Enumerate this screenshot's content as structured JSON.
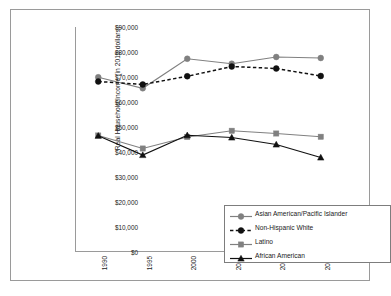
{
  "chart_data": {
    "type": "line",
    "title": "",
    "xlabel": "",
    "ylabel": "Real Household Income (in 2015 dollars)",
    "x": [
      1990,
      1995,
      2000,
      2005,
      2010,
      2015
    ],
    "categories": [
      "1990",
      "1995",
      "2000",
      "2005",
      "2010",
      "2015"
    ],
    "xticklabels": [
      "1990",
      "1995",
      "2000",
      "2005",
      "2010",
      "2015"
    ],
    "yticklabels": [
      "$0",
      "$10,000",
      "$20,000",
      "$30,000",
      "$40,000",
      "$50,000",
      "$60,000",
      "$70,000",
      "$80,000",
      "$90,000"
    ],
    "ytickvalues": [
      0,
      10000,
      20000,
      30000,
      40000,
      50000,
      60000,
      70000,
      80000,
      90000
    ],
    "ylim": [
      0,
      90000
    ],
    "xlim": [
      1990,
      2015
    ],
    "grid": false,
    "legend_position": "center-right-inside",
    "series": [
      {
        "name": "Asian American/Pacific Islander",
        "color": "#808080",
        "marker": "diamond",
        "linestyle": "solid",
        "values": [
          69900,
          65500,
          77300,
          75300,
          78000,
          77600
        ]
      },
      {
        "name": "Non-Hispanic White",
        "color": "#111111",
        "marker": "diamond",
        "linestyle": "dashed",
        "values": [
          68200,
          67000,
          70300,
          74200,
          73400,
          70400
        ]
      },
      {
        "name": "Latino",
        "color": "#808080",
        "marker": "square",
        "linestyle": "solid",
        "values": [
          46600,
          41400,
          46000,
          48500,
          47400,
          46100
        ]
      },
      {
        "name": "African American",
        "color": "#111111",
        "marker": "triangle",
        "linestyle": "solid",
        "values": [
          46500,
          38800,
          46700,
          45800,
          43000,
          37800
        ]
      }
    ]
  },
  "colors": {
    "gray_series": "#808080",
    "black_series": "#111111",
    "axis": "#9a9a9a",
    "frame": "#9a9a9a",
    "text": "#1a1a1a",
    "background": "#ffffff"
  }
}
